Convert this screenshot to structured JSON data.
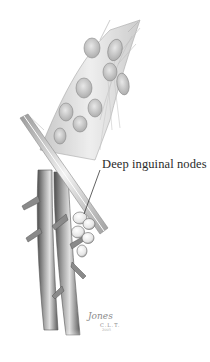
{
  "figure": {
    "label": "Deep inguinal nodes",
    "signature": {
      "name": "Jones",
      "initials": "C.L.T.",
      "year": "2005"
    },
    "colors": {
      "background": "#ffffff",
      "vessel_dark": "#5a5a5a",
      "vessel_mid": "#8c8c8c",
      "vessel_light": "#d6d6d6",
      "node_fill": "#f4f4f4",
      "ligament": "#cfcfcf",
      "label_text": "#2a2a2a"
    }
  }
}
